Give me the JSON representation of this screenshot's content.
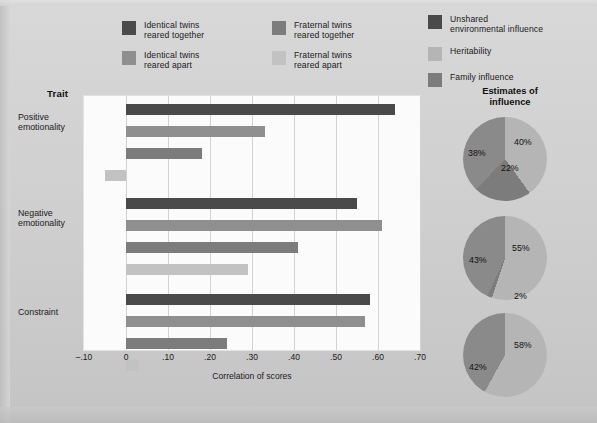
{
  "legend_left": [
    {
      "label": "Identical twins\nreared together",
      "color": "#4a4a4a",
      "key": "identical_together"
    },
    {
      "label": "Identical twins\nreared apart",
      "color": "#8f8f8f",
      "key": "identical_apart"
    },
    {
      "label": "Fraternal twins\nreared together",
      "color": "#7c7c7c",
      "key": "fraternal_together"
    },
    {
      "label": "Fraternal twins\nreared apart",
      "color": "#c2c2c2",
      "key": "fraternal_apart"
    }
  ],
  "legend_right": [
    {
      "label": "Unshared\nenvironmental influence",
      "color": "#4a4a4a",
      "key": "unshared_environment"
    },
    {
      "label": "Heritability",
      "color": "#b5b5b5",
      "key": "heritability"
    },
    {
      "label": "Family influence",
      "color": "#7c7c7c",
      "key": "family_influence"
    }
  ],
  "axis": {
    "trait_header": "Trait",
    "x_title": "Correlation of scores",
    "ticks": [
      "–.10",
      "0",
      ".10",
      ".20",
      ".30",
      ".40",
      ".50",
      ".60",
      ".70"
    ],
    "tick_values": [
      -0.1,
      0,
      0.1,
      0.2,
      0.3,
      0.4,
      0.5,
      0.6,
      0.7
    ]
  },
  "pies_header": "Estimates of\ninfluence",
  "chart_data": [
    {
      "type": "bar",
      "orientation": "horizontal",
      "title": "",
      "xlabel": "Correlation of scores",
      "ylabel": "Trait",
      "xlim": [
        -0.1,
        0.7
      ],
      "grid": true,
      "categories": [
        "Positive emotionality",
        "Negative emotionality",
        "Constraint"
      ],
      "series": [
        {
          "name": "Identical twins reared together",
          "color": "#4a4a4a",
          "values": [
            0.64,
            0.55,
            0.58
          ]
        },
        {
          "name": "Identical twins reared apart",
          "color": "#8f8f8f",
          "values": [
            0.33,
            0.61,
            0.57
          ]
        },
        {
          "name": "Fraternal twins reared together",
          "color": "#7c7c7c",
          "values": [
            0.18,
            0.41,
            0.24
          ]
        },
        {
          "name": "Fraternal twins reared apart",
          "color": "#c2c2c2",
          "values": [
            -0.05,
            0.29,
            0.03
          ]
        }
      ]
    },
    {
      "type": "pie",
      "title": "Positive emotionality",
      "legend_position": "top-right",
      "labels": [
        "Heritability",
        "Family influence",
        "Unshared environmental influence"
      ],
      "values": [
        40,
        22,
        38
      ],
      "value_labels": [
        "40%",
        "22%",
        "38%"
      ],
      "colors": [
        "#b5b5b5",
        "#7c7c7c",
        "#8a8a8a"
      ]
    },
    {
      "type": "pie",
      "title": "Negative emotionality",
      "legend_position": "top-right",
      "labels": [
        "Heritability",
        "Family influence",
        "Unshared environmental influence"
      ],
      "values": [
        55,
        2,
        43
      ],
      "value_labels": [
        "55%",
        "2%",
        "43%"
      ],
      "colors": [
        "#b5b5b5",
        "#7c7c7c",
        "#8a8a8a"
      ]
    },
    {
      "type": "pie",
      "title": "Constraint",
      "legend_position": "top-right",
      "labels": [
        "Heritability",
        "Unshared environmental influence"
      ],
      "values": [
        58,
        42
      ],
      "value_labels": [
        "58%",
        "42%"
      ],
      "colors": [
        "#b5b5b5",
        "#8a8a8a"
      ]
    }
  ],
  "trait_labels": [
    "Positive\nemotionality",
    "Negative\nemotionality",
    "Constraint"
  ],
  "pie_value_labels": {
    "pie0": [
      "22%",
      "40%",
      "38%"
    ],
    "pie1": [
      "43%",
      "2%",
      "55%"
    ],
    "pie2": [
      "42%",
      "58%"
    ]
  }
}
